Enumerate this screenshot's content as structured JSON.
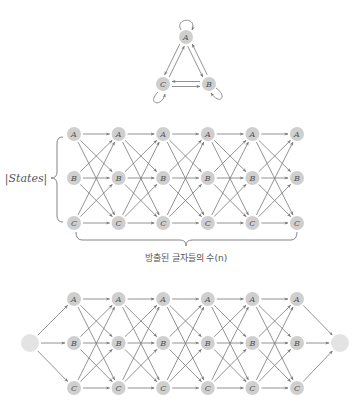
{
  "colors": {
    "node_fill": "#cfcfcf",
    "terminal_fill": "#e3e3e3",
    "edge": "#777777",
    "label": "#555555"
  },
  "state_names": [
    "A",
    "B",
    "C"
  ],
  "triangle": {
    "nodes": [
      {
        "label": "A",
        "x": 186,
        "y": 37
      },
      {
        "label": "B",
        "x": 209,
        "y": 84
      },
      {
        "label": "C",
        "x": 163,
        "y": 84
      }
    ],
    "self_loops": [
      "A",
      "B",
      "C"
    ],
    "edges": [
      [
        "A",
        "B"
      ],
      [
        "B",
        "A"
      ],
      [
        "A",
        "C"
      ],
      [
        "C",
        "A"
      ],
      [
        "B",
        "C"
      ],
      [
        "C",
        "B"
      ]
    ]
  },
  "trellis": {
    "columns_x": [
      74,
      118.6,
      163.2,
      207.8,
      252.4,
      297
    ],
    "rows_y": [
      134,
      178,
      223
    ],
    "fully_connected": true
  },
  "states_label": "|States|",
  "brace_label": "방출된 글자들의 수(n)",
  "trellis_with_terminals": {
    "columns_x": [
      74,
      118.6,
      163.2,
      207.8,
      252.4,
      297
    ],
    "rows_y": [
      299,
      343,
      388
    ],
    "start_node": {
      "x": 30,
      "y": 343
    },
    "end_node": {
      "x": 340,
      "y": 343
    }
  }
}
